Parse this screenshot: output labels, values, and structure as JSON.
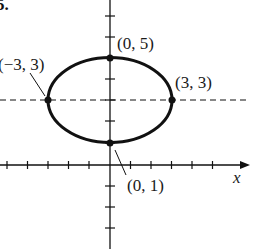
{
  "problem_number": "5.",
  "axes": {
    "x_label": "x",
    "tick_spacing_px": 20.5
  },
  "ellipse": {
    "center": [
      0,
      3
    ],
    "a": 3,
    "b": 2
  },
  "points": [
    {
      "label": "(0, 5)",
      "x": 0,
      "y": 5
    },
    {
      "label": "(−3, 3)",
      "x": -3,
      "y": 3
    },
    {
      "label": "(3, 3)",
      "x": 3,
      "y": 3
    },
    {
      "label": "(0, 1)",
      "x": 0,
      "y": 1
    }
  ],
  "colors": {
    "ink": "#111111",
    "background": "#ffffff"
  }
}
